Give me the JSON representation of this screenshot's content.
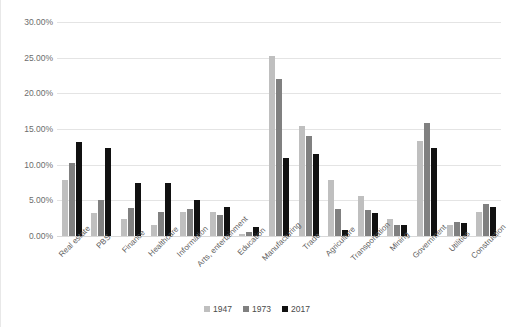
{
  "chart_data": {
    "type": "bar",
    "title": "",
    "subtitle": "",
    "xlabel": "",
    "ylabel": "",
    "ylim": [
      0,
      30
    ],
    "y_tick_labels": [
      "30.00%",
      "25.00%",
      "20.00%",
      "15.00%",
      "10.00%",
      "5.00%",
      "0.00%"
    ],
    "y_tick_values": [
      30,
      25,
      20,
      15,
      10,
      5,
      0
    ],
    "grid": true,
    "legend_position": "bottom",
    "value_unit": "percent",
    "categories": [
      "Real estate",
      "PBS",
      "Finance",
      "Healthcare",
      "Information",
      "Arts, entertainment",
      "Education",
      "Manufacturing",
      "Trade",
      "Agriculture",
      "Transportation",
      "Mining",
      "Government",
      "Utilities",
      "Construction"
    ],
    "series": [
      {
        "name": "1947",
        "color": "#bfbfbf",
        "values": [
          7.8,
          3.2,
          2.4,
          1.5,
          3.4,
          3.3,
          0.3,
          25.3,
          15.4,
          7.9,
          5.6,
          2.4,
          13.3,
          1.6,
          3.4
        ]
      },
      {
        "name": "1973",
        "color": "#808080",
        "values": [
          10.3,
          5.0,
          3.9,
          3.3,
          3.8,
          3.0,
          0.6,
          22.0,
          14.0,
          3.8,
          3.6,
          1.5,
          15.9,
          2.0,
          4.5
        ]
      },
      {
        "name": "2017",
        "color": "#111111",
        "values": [
          13.2,
          12.3,
          7.5,
          7.4,
          5.1,
          4.0,
          1.3,
          11.0,
          11.5,
          0.9,
          3.2,
          1.5,
          12.3,
          1.8,
          4.1
        ]
      }
    ]
  }
}
